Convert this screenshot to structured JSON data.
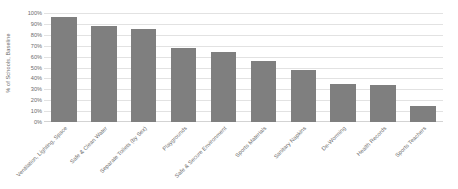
{
  "chart_data": {
    "type": "bar",
    "title": "",
    "xlabel": "",
    "ylabel": "% of Schools, Baseline",
    "ylim": [
      0,
      100
    ],
    "grid": true,
    "legend": "none",
    "bar_color": "#7f7f7f",
    "gridline_color": "#e2e2e2",
    "axis_text_color": "#6b6b6b",
    "y_tick_labels": [
      "100%",
      "90%",
      "80%",
      "70%",
      "60%",
      "50%",
      "40%",
      "30%",
      "20%",
      "10%",
      "0%"
    ],
    "y_tick_values": [
      100,
      90,
      80,
      70,
      60,
      50,
      40,
      30,
      20,
      10,
      0
    ],
    "categories": [
      "Ventilation, Lighting, Space",
      "Safe & Clean Water",
      "Separate Toilets (by Sex)",
      "Playgrounds",
      "Safe & Secure Environment",
      "Sports Materials",
      "Sanitary Napkins",
      "De-Worming",
      "Health Records",
      "Sports Teachers"
    ],
    "values": [
      96,
      88,
      85,
      68,
      64,
      56,
      48,
      35,
      34,
      15
    ],
    "series": [
      {
        "name": "% of Schools, Baseline",
        "values": [
          96,
          88,
          85,
          68,
          64,
          56,
          48,
          35,
          34,
          15
        ]
      }
    ]
  }
}
